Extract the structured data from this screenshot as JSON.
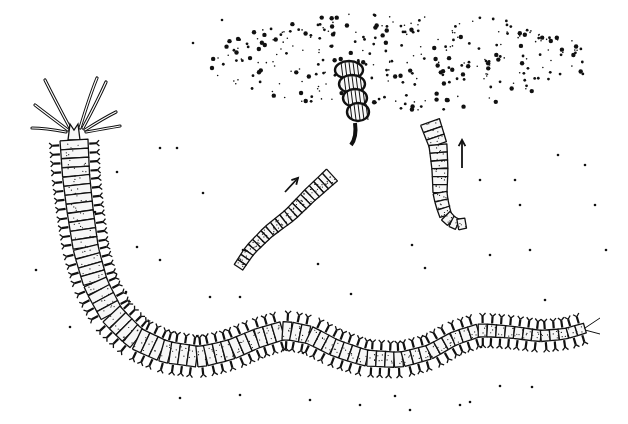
{
  "illustration": {
    "subject": "pen-and-ink drawing of a segmented bristle worm with body fragments in sediment",
    "colors": {
      "ink": "#111111",
      "paper": "#ffffff",
      "segment_fill": "#f7f7f7"
    },
    "main_worm": {
      "head": {
        "x": 74,
        "y": 138
      },
      "spine": [
        [
          74,
          140
        ],
        [
          76,
          175
        ],
        [
          80,
          210
        ],
        [
          86,
          250
        ],
        [
          96,
          285
        ],
        [
          112,
          315
        ],
        [
          135,
          338
        ],
        [
          165,
          352
        ],
        [
          200,
          357
        ],
        [
          230,
          350
        ],
        [
          258,
          338
        ],
        [
          285,
          330
        ],
        [
          310,
          335
        ],
        [
          335,
          348
        ],
        [
          365,
          358
        ],
        [
          400,
          360
        ],
        [
          430,
          352
        ],
        [
          455,
          338
        ],
        [
          480,
          330
        ],
        [
          510,
          332
        ],
        [
          540,
          336
        ],
        [
          565,
          334
        ],
        [
          585,
          328
        ]
      ],
      "width_start": 28,
      "width_end": 10,
      "tentacles": [
        [
          [
            70,
            128
          ],
          [
            55,
            100
          ],
          [
            45,
            80
          ]
        ],
        [
          [
            68,
            130
          ],
          [
            48,
            115
          ],
          [
            35,
            105
          ]
        ],
        [
          [
            66,
            132
          ],
          [
            45,
            128
          ],
          [
            32,
            128
          ]
        ],
        [
          [
            80,
            128
          ],
          [
            90,
            95
          ],
          [
            97,
            78
          ]
        ],
        [
          [
            83,
            128
          ],
          [
            98,
            100
          ],
          [
            106,
            82
          ]
        ],
        [
          [
            85,
            130
          ],
          [
            104,
            118
          ],
          [
            116,
            112
          ]
        ],
        [
          [
            86,
            132
          ],
          [
            108,
            128
          ],
          [
            120,
            126
          ]
        ]
      ],
      "tail_cirri": [
        [
          [
            585,
            328
          ],
          [
            600,
            318
          ]
        ],
        [
          [
            585,
            330
          ],
          [
            600,
            334
          ]
        ]
      ]
    },
    "fragment_straight": {
      "spine": [
        [
          332,
          175
        ],
        [
          310,
          195
        ],
        [
          290,
          215
        ],
        [
          268,
          232
        ],
        [
          250,
          250
        ],
        [
          238,
          268
        ]
      ],
      "width_start": 16,
      "width_end": 10
    },
    "fragment_curved": {
      "spine": [
        [
          430,
          122
        ],
        [
          438,
          145
        ],
        [
          440,
          170
        ],
        [
          440,
          195
        ],
        [
          445,
          215
        ],
        [
          455,
          225
        ],
        [
          472,
          222
        ]
      ],
      "width_start": 20,
      "width_end": 10
    },
    "coiled_fragment": {
      "cx": 355,
      "cy": 95,
      "loops": 4
    },
    "arrows": [
      {
        "name": "arrow-straight-fragment",
        "x1": 285,
        "y1": 192,
        "x2": 298,
        "y2": 178
      },
      {
        "name": "arrow-curved-fragment",
        "x1": 462,
        "y1": 168,
        "x2": 462,
        "y2": 140
      }
    ],
    "sediment_cloud": {
      "cx": 400,
      "cy": 62,
      "rx": 190,
      "ry": 50,
      "count": 320,
      "seed": 7
    },
    "scattered_dots": [
      [
        193,
        43
      ],
      [
        222,
        20
      ],
      [
        160,
        148
      ],
      [
        177,
        148
      ],
      [
        117,
        172
      ],
      [
        95,
        212
      ],
      [
        137,
        247
      ],
      [
        203,
        193
      ],
      [
        243,
        250
      ],
      [
        291,
        208
      ],
      [
        210,
        297
      ],
      [
        240,
        297
      ],
      [
        318,
        264
      ],
      [
        351,
        294
      ],
      [
        412,
        245
      ],
      [
        425,
        268
      ],
      [
        449,
        206
      ],
      [
        480,
        180
      ],
      [
        515,
        180
      ],
      [
        520,
        205
      ],
      [
        490,
        255
      ],
      [
        530,
        250
      ],
      [
        545,
        300
      ],
      [
        558,
        155
      ],
      [
        585,
        165
      ],
      [
        595,
        205
      ],
      [
        70,
        327
      ],
      [
        160,
        260
      ],
      [
        126,
        292
      ],
      [
        36,
        270
      ],
      [
        606,
        250
      ],
      [
        180,
        398
      ],
      [
        240,
        395
      ],
      [
        310,
        400
      ],
      [
        360,
        405
      ],
      [
        395,
        396
      ],
      [
        410,
        410
      ],
      [
        460,
        405
      ],
      [
        500,
        386
      ],
      [
        532,
        387
      ],
      [
        470,
        402
      ]
    ]
  }
}
